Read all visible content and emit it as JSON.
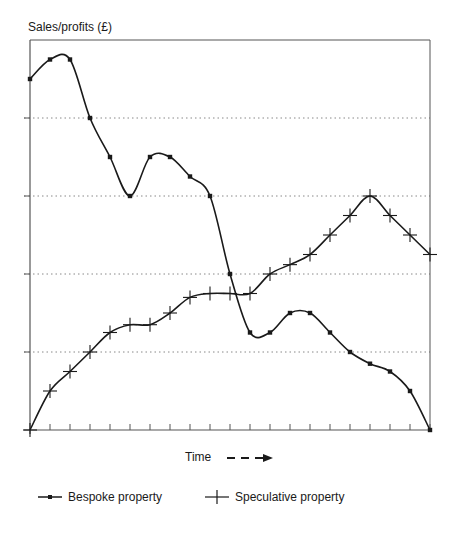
{
  "chart_data": {
    "type": "line",
    "title": "",
    "ylabel": "Sales/profits (£)",
    "xlabel": "Time",
    "xlabel_arrow": "dashed-right-arrow",
    "x": [
      0,
      1,
      2,
      3,
      4,
      5,
      6,
      7,
      8,
      9,
      10,
      11,
      12,
      13,
      14,
      15,
      16,
      17,
      18,
      19,
      20
    ],
    "xlim": [
      0,
      20
    ],
    "ylim": [
      0,
      5
    ],
    "yticks": [
      0,
      1,
      2,
      3,
      4,
      5
    ],
    "ytick_labels": [],
    "grid": "horizontal dotted at y=1,2,3,4",
    "legend_position": "bottom",
    "series": [
      {
        "name": "Bespoke property",
        "marker": "square-dot",
        "values": [
          4.5,
          4.75,
          4.75,
          4.0,
          3.5,
          3.0,
          3.5,
          3.5,
          3.25,
          3.0,
          2.0,
          1.25,
          1.25,
          1.5,
          1.5,
          1.25,
          1.0,
          0.85,
          0.75,
          0.5,
          0.0
        ]
      },
      {
        "name": "Speculative property",
        "marker": "plus",
        "values": [
          0.0,
          0.5,
          0.75,
          1.0,
          1.25,
          1.35,
          1.35,
          1.5,
          1.7,
          1.75,
          1.75,
          1.75,
          2.0,
          2.12,
          2.25,
          2.5,
          2.75,
          3.0,
          2.75,
          2.5,
          2.25
        ]
      }
    ]
  },
  "labels": {
    "ylabel": "Sales/profits (£)",
    "xlabel": "Time"
  },
  "legend": {
    "items": [
      {
        "label": "Bespoke property",
        "icon": "line-with-dot-icon"
      },
      {
        "label": "Speculative property",
        "icon": "line-with-plus-icon"
      }
    ]
  }
}
